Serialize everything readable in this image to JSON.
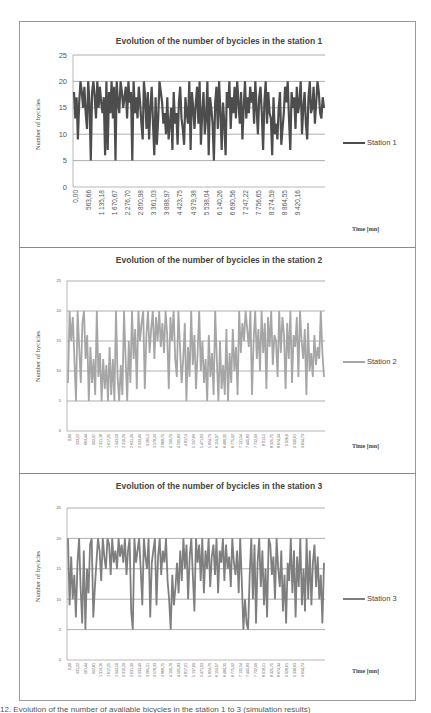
{
  "chart_data": [
    {
      "type": "line",
      "title": "Evolution of the number of bycicles in the station 1",
      "xlabel": "Time [mn]",
      "ylabel": "Number of bycicles",
      "ylim": [
        0,
        25
      ],
      "yticks": [
        0,
        5,
        10,
        15,
        20,
        25
      ],
      "grid": true,
      "legend_position": "right",
      "series": [
        {
          "name": "Station 1",
          "color": "#4d4d4d",
          "values": [
            18,
            13,
            17,
            9,
            16,
            20,
            18,
            15,
            19,
            14,
            11,
            20,
            16,
            5,
            18,
            20,
            17,
            13,
            20,
            15,
            19,
            16,
            14,
            17,
            6,
            20,
            7,
            18,
            14,
            20,
            13,
            19,
            5,
            20,
            16,
            14,
            20,
            18,
            15,
            17,
            19,
            13,
            20,
            16,
            18,
            5,
            20,
            14,
            17,
            13,
            19,
            16,
            12,
            9,
            20,
            17,
            11,
            18,
            9,
            15,
            19,
            12,
            6,
            17,
            8,
            13,
            20,
            18,
            16,
            12,
            14,
            10,
            17,
            9,
            12,
            15,
            7,
            18,
            12,
            14,
            8,
            16,
            19,
            13,
            11,
            8,
            17,
            14,
            12,
            20,
            7,
            18,
            15,
            11,
            16,
            19,
            12,
            20,
            8,
            14,
            18,
            10,
            13,
            20,
            6,
            17,
            15,
            12,
            5,
            16,
            19,
            11,
            20,
            14,
            7,
            16,
            12,
            6,
            18,
            15,
            20,
            11,
            17,
            14,
            19,
            13,
            20,
            16,
            12,
            18,
            9,
            15,
            20,
            13,
            17,
            14,
            19,
            16,
            18,
            12,
            20,
            15,
            10,
            17,
            19,
            14,
            7,
            16,
            20,
            12,
            18,
            14,
            13,
            6,
            17,
            10,
            12,
            9,
            15,
            18,
            8,
            11,
            14,
            19,
            16,
            20,
            13,
            7,
            18,
            15,
            17,
            11,
            19,
            14,
            16,
            20,
            10,
            15,
            18,
            12,
            9,
            17,
            20,
            14,
            15,
            19,
            12,
            16,
            20,
            18,
            14,
            13,
            17,
            15
          ]
        }
      ],
      "categories": [
        "0,00",
        "563,66",
        "1 135,18",
        "1 670,67",
        "2 276,70",
        "2 800,98",
        "3 361,03",
        "3 888,97",
        "4 423,75",
        "4 979,38",
        "5 538,04",
        "6 140,26",
        "6 690,56",
        "7 247,22",
        "7 756,65",
        "8 274,59",
        "8 864,55",
        "9 420,16"
      ]
    },
    {
      "type": "line",
      "title": "Evolution of the number of bycicles in the station 2",
      "xlabel": "Time [mn]",
      "ylabel": "Number of bycicles",
      "ylim": [
        0,
        25
      ],
      "yticks": [
        0,
        5,
        10,
        15,
        20,
        25
      ],
      "grid": true,
      "legend_position": "right",
      "series": [
        {
          "name": "Station 2",
          "color": "#a6a6a6",
          "values": [
            8,
            20,
            15,
            19,
            12,
            5,
            20,
            14,
            8,
            18,
            20,
            12,
            16,
            5,
            14,
            8,
            12,
            6,
            20,
            9,
            13,
            5,
            12,
            7,
            11,
            5,
            14,
            6,
            12,
            5,
            20,
            9,
            5,
            11,
            6,
            20,
            12,
            5,
            15,
            8,
            20,
            12,
            17,
            7,
            20,
            15,
            18,
            20,
            7,
            16,
            20,
            13,
            17,
            20,
            12,
            19,
            15,
            20,
            14,
            18,
            13,
            20,
            16,
            7,
            19,
            15,
            20,
            12,
            9,
            20,
            14,
            8,
            12,
            18,
            5,
            14,
            9,
            20,
            11,
            16,
            7,
            13,
            20,
            10,
            15,
            8,
            12,
            5,
            16,
            9,
            13,
            6,
            20,
            12,
            5,
            15,
            7,
            11,
            6,
            17,
            5,
            13,
            8,
            17,
            10,
            14,
            6,
            20,
            13,
            18,
            15,
            20,
            17,
            14,
            20,
            6,
            15,
            20,
            12,
            17,
            10,
            20,
            13,
            18,
            7,
            19,
            14,
            20,
            11,
            16,
            15,
            9,
            20,
            13,
            19,
            16,
            7,
            18,
            12,
            20,
            8,
            16,
            14,
            19,
            9,
            20,
            15,
            12,
            17,
            6,
            18,
            10,
            13,
            9,
            16,
            11,
            14,
            12,
            20,
            13,
            9
          ]
        }
      ],
      "categories": [
        "0,00",
        "333,22",
        "663,44",
        "992,37",
        "1 311,16",
        "1 617,25",
        "1 943,50",
        "2 310,29",
        "2 631,39",
        "2 933,49",
        "3 265,5",
        "3 578,33",
        "3 868,75",
        "4 190,79",
        "4 505,83",
        "4 817,9",
        "5 137,69",
        "5 471,03",
        "5 824,79",
        "6 159,07",
        "6 480,35",
        "6 775,92",
        "7 131,54",
        "7 445,83",
        "7 732,99",
        "8 013,5",
        "8 325,75",
        "8 674,34",
        "9 026,6",
        "9 330,61",
        "9 634,73"
      ]
    },
    {
      "type": "line",
      "title": "Evolution of the number of bycicles in the station 3",
      "xlabel": "Time [mn]",
      "ylabel": "Number of bycicles",
      "ylim": [
        0,
        25
      ],
      "yticks": [
        0,
        5,
        10,
        15,
        20,
        25
      ],
      "grid": true,
      "legend_position": "right",
      "series": [
        {
          "name": "Station 3",
          "color": "#7f7f7f",
          "values": [
            20,
            9,
            17,
            10,
            14,
            7,
            16,
            20,
            12,
            6,
            18,
            5,
            15,
            11,
            19,
            20,
            7,
            12,
            16,
            20,
            18,
            13,
            20,
            17,
            15,
            20,
            19,
            14,
            20,
            16,
            18,
            15,
            20,
            17,
            19,
            16,
            20,
            14,
            18,
            20,
            8,
            5,
            20,
            16,
            18,
            20,
            15,
            9,
            20,
            17,
            15,
            20,
            7,
            16,
            18,
            20,
            9,
            17,
            20,
            14,
            18,
            16,
            20,
            13,
            10,
            5,
            14,
            9,
            12,
            16,
            11,
            18,
            13,
            20,
            15,
            19,
            10,
            17,
            20,
            14,
            8,
            20,
            16,
            19,
            13,
            20,
            11,
            18,
            15,
            20,
            12,
            17,
            19,
            14,
            20,
            11,
            18,
            16,
            20,
            13,
            19,
            15,
            17,
            12,
            20,
            16,
            14,
            18,
            11,
            20,
            13,
            5,
            10,
            6,
            5,
            14,
            20,
            10,
            19,
            6,
            16,
            20,
            12,
            18,
            9,
            15,
            7,
            20,
            19,
            14,
            17,
            10,
            20,
            15,
            12,
            18,
            8,
            14,
            6,
            16,
            13,
            20,
            11,
            18,
            7,
            17,
            12,
            20,
            9,
            15,
            8,
            20,
            10,
            18,
            9,
            16,
            19,
            12,
            17,
            10,
            14,
            6,
            16
          ]
        }
      ],
      "categories": [
        "0,00",
        "331,22",
        "561,44",
        "992,81",
        "1 313,16",
        "1 617,25",
        "1 943,50",
        "2 310,29",
        "2 631,39",
        "2 933,49",
        "3 265,51",
        "3 578,33",
        "3 868,75",
        "4 190,70",
        "4 505,83",
        "4 817,91",
        "5 137,69",
        "5 471,03",
        "5 824,79",
        "6 159,07",
        "6 480,35",
        "6 775,92",
        "7 132,54",
        "7 445,83",
        "7 732,99",
        "8 018,51",
        "8 325,75",
        "8 674,34",
        "9 028,61",
        "9 338,63",
        "9 634,73"
      ]
    }
  ],
  "caption": "12. Evolution of the number of available bicycles in the station 1 to 3 (simulation results)"
}
